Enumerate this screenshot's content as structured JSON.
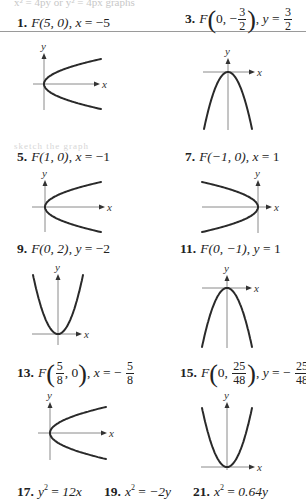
{
  "page": {
    "ghost_text_top": "x² = 4py or y² = 4px graphs",
    "ghost_text_mid": "sketch the graph"
  },
  "problems": [
    {
      "number": "1.",
      "focus": "F(5, 0)",
      "directrix_var": "x",
      "directrix_val": "−5"
    },
    {
      "number": "3.",
      "focus_prefix": "F",
      "focus_x": "0",
      "focus_y_sign": "−",
      "focus_y_num": "3",
      "focus_y_den": "2",
      "directrix_var": "y",
      "directrix_num": "3",
      "directrix_den": "2"
    },
    {
      "number": "5.",
      "focus": "F(1, 0)",
      "directrix_var": "x",
      "directrix_val": "−1"
    },
    {
      "number": "7.",
      "focus": "F(−1, 0)",
      "directrix_var": "x",
      "directrix_val": "1"
    },
    {
      "number": "9.",
      "focus": "F(0, 2)",
      "directrix_var": "y",
      "directrix_val": "−2"
    },
    {
      "number": "11.",
      "focus": "F(0, −1)",
      "directrix_var": "y",
      "directrix_val": "1"
    },
    {
      "number": "13.",
      "focus_prefix": "F",
      "focus_x_num": "5",
      "focus_x_den": "8",
      "focus_y": "0",
      "directrix_var": "x",
      "directrix_sign": "−",
      "directrix_num": "5",
      "directrix_den": "8"
    },
    {
      "number": "15.",
      "focus_prefix": "F",
      "focus_x": "0",
      "focus_y_num": "25",
      "focus_y_den": "48",
      "directrix_var": "y",
      "directrix_sign": "−",
      "directrix_num": "25",
      "directrix_den": "48"
    }
  ],
  "equations": [
    {
      "number": "17.",
      "lhs_var": "y",
      "exp": "2",
      "rhs": "12x"
    },
    {
      "number": "19.",
      "lhs_var": "x",
      "exp": "2",
      "rhs": "−2y"
    },
    {
      "number": "21.",
      "lhs_var": "x",
      "exp": "2",
      "rhs": "0.64y"
    }
  ],
  "axis_labels": {
    "x": "x",
    "y": "y"
  },
  "colors": {
    "curve": "#2a2a2a",
    "axis": "#8a8a8a",
    "rule": "#9a9a9a"
  },
  "graphs": [
    {
      "id": "g1",
      "orientation": "right",
      "origin": [
        44,
        84
      ],
      "yaxis": [
        53,
        110
      ],
      "xaxis": [
        33,
        100
      ],
      "ends": [
        [
          101,
          59
        ],
        [
          101,
          109
        ]
      ]
    },
    {
      "id": "g3",
      "orientation": "down",
      "origin": [
        228,
        72
      ],
      "yaxis": [
        58,
        130
      ],
      "xaxis": [
        203,
        255
      ],
      "ends": [
        [
          204,
          129
        ],
        [
          252,
          129
        ]
      ]
    },
    {
      "id": "g5",
      "orientation": "right",
      "origin": [
        45,
        207
      ],
      "yaxis": [
        180,
        232
      ],
      "xaxis": [
        32,
        105
      ],
      "ends": [
        [
          101,
          182
        ],
        [
          101,
          231
        ]
      ]
    },
    {
      "id": "g7",
      "orientation": "left",
      "origin": [
        258,
        207
      ],
      "yaxis": [
        180,
        233
      ],
      "xaxis": [
        202,
        272
      ],
      "ends": [
        [
          202,
          182
        ],
        [
          202,
          232
        ]
      ]
    },
    {
      "id": "g9",
      "orientation": "up",
      "origin": [
        58,
        334
      ],
      "yaxis": [
        274,
        345
      ],
      "xaxis": [
        32,
        82
      ],
      "ends": [
        [
          33,
          275
        ],
        [
          82,
          275
        ]
      ]
    },
    {
      "id": "g11",
      "orientation": "down",
      "origin": [
        227,
        288
      ],
      "yaxis": [
        275,
        348
      ],
      "xaxis": [
        202,
        252
      ],
      "ends": [
        [
          202,
          347
        ],
        [
          251,
          347
        ]
      ]
    },
    {
      "id": "g13",
      "orientation": "right",
      "origin": [
        50,
        433
      ],
      "yaxis": [
        402,
        460
      ],
      "xaxis": [
        38,
        107
      ],
      "ends": [
        [
          106,
          408
        ],
        [
          106,
          459
        ]
      ]
    },
    {
      "id": "g15",
      "orientation": "up",
      "origin": [
        227,
        467
      ],
      "yaxis": [
        402,
        470
      ],
      "xaxis": [
        201,
        255
      ],
      "ends": [
        [
          202,
          408
        ],
        [
          251,
          408
        ]
      ]
    }
  ]
}
